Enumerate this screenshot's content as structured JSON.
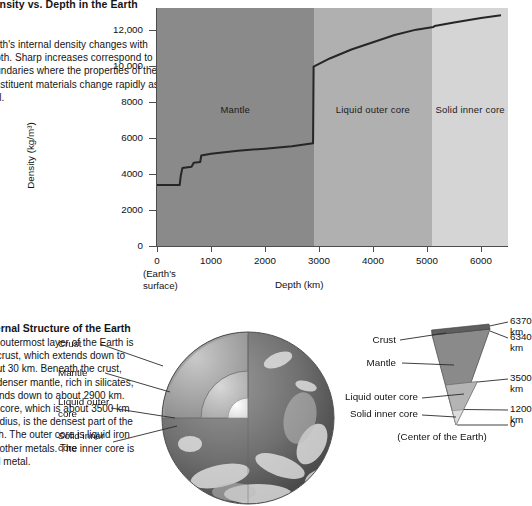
{
  "caption": {
    "heading": "Density vs. Depth in the Earth",
    "body": "Earth's internal density changes with depth. Sharp increases correspond to boundaries where the properties of the constituent materials change rapidly as well."
  },
  "lower_caption": {
    "heading": "Internal Structure of the Earth",
    "body": "The outermost layer of the Earth is the crust, which extends down to about 30 km. Beneath the crust, the denser mantle, rich in silicates, extends down to about 2900 km. The core, which is about 3500 km in radius, is the densest part of the Earth. The outer core is liquid iron and other metals. The inner core is solid metal."
  },
  "chart_data": {
    "type": "line",
    "title": "Density vs. Depth in the Earth",
    "xlabel": "Depth (km)",
    "ylabel": "Density (kg/m³)",
    "xlim": [
      0,
      6500
    ],
    "ylim": [
      0,
      13200
    ],
    "grid": false,
    "legend_position": "none",
    "x_ticks": [
      0,
      1000,
      2000,
      3000,
      4000,
      5000,
      6000
    ],
    "x_tick_labels": [
      "0",
      "1000",
      "2000",
      "3000",
      "4000",
      "5000",
      "6000"
    ],
    "y_ticks": [
      0,
      2000,
      4000,
      6000,
      8000,
      10000,
      12000
    ],
    "y_tick_labels": [
      "0",
      "2000",
      "4000",
      "6000",
      "8000",
      "10,000",
      "12,000"
    ],
    "origin_annotation": "(Earth's surface)",
    "series": [
      {
        "name": "Density",
        "color": "#262626",
        "x": [
          0,
          420,
          440,
          470,
          640,
          660,
          680,
          800,
          820,
          1000,
          1500,
          2000,
          2500,
          2890,
          2900,
          3200,
          3600,
          4000,
          4400,
          4800,
          5120,
          5140,
          5500,
          6000,
          6370
        ],
        "y": [
          3380,
          3380,
          3900,
          4320,
          4400,
          4500,
          4620,
          4660,
          5020,
          5120,
          5280,
          5400,
          5530,
          5700,
          9950,
          10400,
          10900,
          11300,
          11700,
          12000,
          12150,
          12200,
          12400,
          12650,
          12800
        ]
      }
    ],
    "regions": [
      {
        "label": "Mantle",
        "x_start": 0,
        "x_end": 2900,
        "color": "#8a8a8a"
      },
      {
        "label": "Liquid outer core",
        "x_start": 2900,
        "x_end": 5100,
        "color": "#b0b0b0"
      },
      {
        "label": "Solid inner core",
        "x_start": 5100,
        "x_end": 6500,
        "color": "#d5d5d5"
      }
    ]
  },
  "earth_figure": {
    "callouts": [
      {
        "label": "Crust"
      },
      {
        "label": "Mantle"
      },
      {
        "label": "Liquid outer core"
      },
      {
        "label": "Solid inner core"
      }
    ]
  },
  "wedge_figure": {
    "left_labels": [
      "Crust",
      "Mantle",
      "Liquid outer core",
      "Solid inner core"
    ],
    "right_labels": [
      "6370 km",
      "6340 km",
      "3500 km",
      "1200 km",
      "0"
    ],
    "center_note": "(Center of the Earth)"
  }
}
